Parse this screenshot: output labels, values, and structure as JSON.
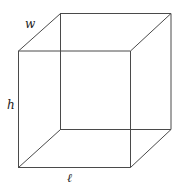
{
  "diagram": {
    "type": "rectangular-prism-wireframe",
    "line_color": "#4a4a4a",
    "labels": {
      "width": "w",
      "height": "h",
      "length": "ℓ"
    },
    "vertices": {
      "front_top_left": [
        18,
        51
      ],
      "front_top_right": [
        130.5,
        51
      ],
      "front_bottom_left": [
        18,
        167.5
      ],
      "front_bottom_right": [
        130.5,
        167.5
      ],
      "back_top_left": [
        60,
        13.5
      ],
      "back_top_right": [
        171,
        13.5
      ],
      "back_bottom_left": [
        60,
        129.5
      ],
      "back_bottom_right": [
        171,
        129.5
      ]
    }
  }
}
